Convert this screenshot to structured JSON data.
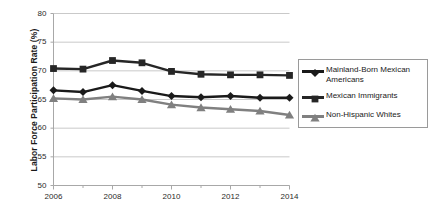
{
  "chart_data": {
    "type": "line",
    "title": "",
    "subtitle": "",
    "xlabel": "",
    "ylabel": "Labor Force Participation Rate (%)",
    "x": [
      2006,
      2007,
      2008,
      2009,
      2010,
      2011,
      2012,
      2013,
      2014
    ],
    "xlim": [
      2006,
      2014
    ],
    "ylim": [
      50,
      80
    ],
    "xticks": [
      2006,
      2008,
      2010,
      2012,
      2014
    ],
    "xtick_labels": [
      "2006",
      "2008",
      "2010",
      "2012",
      "2014"
    ],
    "xminor_ticks": [
      2007,
      2009,
      2011,
      2013
    ],
    "yticks": [
      50,
      55,
      60,
      65,
      70,
      75,
      80
    ],
    "ytick_labels": [
      "50",
      "55",
      "60",
      "65",
      "70",
      "75",
      "80"
    ],
    "grid": true,
    "grid_axis": "y",
    "legend_position": "right",
    "series": [
      {
        "name": "Mainland-Born Mexican Americans",
        "marker": "diamond",
        "color": "#1a1a1a",
        "values": [
          66.6,
          66.3,
          67.5,
          66.5,
          65.6,
          65.4,
          65.6,
          65.3,
          65.3
        ]
      },
      {
        "name": "Mexican Immigrants",
        "marker": "square",
        "color": "#262626",
        "values": [
          70.4,
          70.3,
          71.8,
          71.4,
          69.9,
          69.4,
          69.3,
          69.3,
          69.2
        ]
      },
      {
        "name": "Non-Hispanic Whites",
        "marker": "triangle",
        "color": "#808080",
        "values": [
          65.2,
          65.0,
          65.5,
          65.0,
          64.1,
          63.6,
          63.3,
          63.0,
          62.3
        ]
      }
    ]
  },
  "legend": {
    "entries": [
      {
        "label": "Mainland-Born Mexican Americans"
      },
      {
        "label": "Mexican Immigrants"
      },
      {
        "label": "Non-Hispanic Whites"
      }
    ]
  },
  "colors": {
    "series_mainland_born": "#1a1a1a",
    "series_immigrants": "#262626",
    "series_white": "#808080",
    "gridline": "#c9c9c9",
    "axis": "#a8a8a8",
    "text": "#1a1a1a"
  }
}
